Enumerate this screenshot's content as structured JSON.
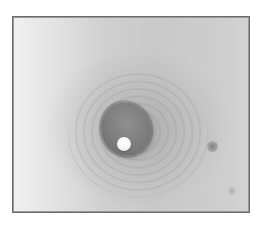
{
  "image": {
    "type": "grayscale photograph",
    "subject": "close-up of skin with central raised pigmented region and white droplet",
    "frame": {
      "border_color": "#6a6a6a",
      "background_color": "#ffffff"
    },
    "colors": {
      "light_skin": "#f1f1f1",
      "mid_skin": "#cfcfcf",
      "dark_center": "#7c7c7c",
      "droplet": "#f5f5f5",
      "spot": "#7d7d7d"
    }
  }
}
